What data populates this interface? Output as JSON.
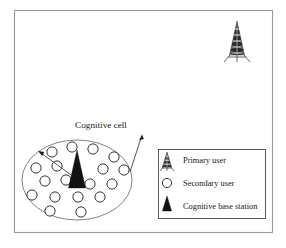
{
  "figure": {
    "type": "network-architecture-diagram",
    "background_color": "#ffffff",
    "frame": {
      "stroke_color": "#9a9a9a",
      "x": 14,
      "y": 10,
      "width": 259,
      "height": 223
    },
    "annotations": {
      "cognitive_cell_label": "Cognitive cell"
    },
    "cell": {
      "name": "cognitive-cell",
      "stroke_color": "#6d6d6d",
      "center_x": 77,
      "center_y": 180,
      "radius_x": 55,
      "radius_y": 40
    },
    "primary_user_tower": {
      "name": "primary-user-tower",
      "x": 237,
      "y": 40,
      "fill_color": "#2a2a2a"
    },
    "cognitive_base_station": {
      "name": "cognitive-base-station",
      "x": 77,
      "y": 180,
      "fill_color": "#111111"
    },
    "secondary_users": {
      "count": 18,
      "fill_color": "#ffffff",
      "stroke_color": "#2b2b2b",
      "radius": 5.1,
      "positions": [
        {
          "x": 52,
          "y": 152
        },
        {
          "x": 72,
          "y": 147
        },
        {
          "x": 93,
          "y": 149
        },
        {
          "x": 114,
          "y": 157
        },
        {
          "x": 36,
          "y": 168
        },
        {
          "x": 57,
          "y": 166
        },
        {
          "x": 103,
          "y": 169
        },
        {
          "x": 124,
          "y": 170
        },
        {
          "x": 45,
          "y": 181
        },
        {
          "x": 66,
          "y": 180
        },
        {
          "x": 90,
          "y": 184
        },
        {
          "x": 112,
          "y": 184
        },
        {
          "x": 32,
          "y": 195
        },
        {
          "x": 55,
          "y": 197
        },
        {
          "x": 78,
          "y": 197
        },
        {
          "x": 100,
          "y": 197
        },
        {
          "x": 50,
          "y": 211
        },
        {
          "x": 81,
          "y": 212
        }
      ]
    },
    "leaders": [
      {
        "name": "base-station-leader",
        "from_x": 78,
        "from_y": 180,
        "to_x": 39,
        "to_y": 152
      },
      {
        "name": "cognitive-cell-leader",
        "from_x": 131,
        "from_y": 171,
        "to_x": 142,
        "to_y": 136
      }
    ]
  },
  "legend": {
    "name": "legend-box",
    "x": 158,
    "y": 149,
    "width": 108,
    "height": 70,
    "border_color": "#4a4a4a",
    "items": [
      {
        "icon": "primary-user-tower-icon",
        "label": "Primary user"
      },
      {
        "icon": "secondary-user-circle-icon",
        "label": "Secondary user"
      },
      {
        "icon": "cognitive-base-station-icon",
        "label": "Cognitive base station"
      }
    ]
  }
}
